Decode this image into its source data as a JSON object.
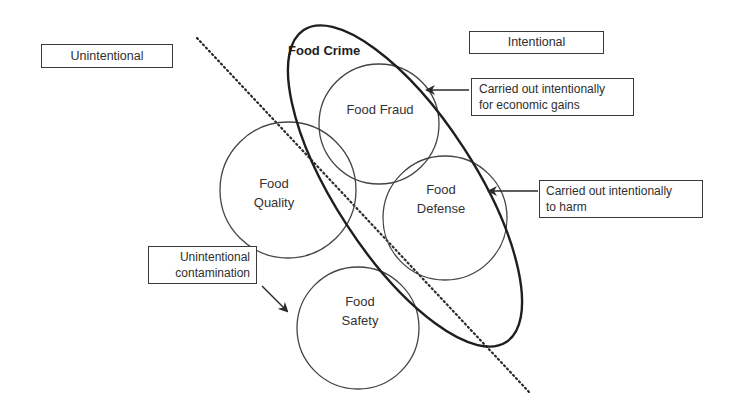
{
  "diagram": {
    "title": "Food Crime",
    "category_labels": {
      "unintentional": "Unintentional",
      "intentional": "Intentional"
    },
    "circles": [
      {
        "id": "food-fraud",
        "lines": [
          "Food Fraud"
        ]
      },
      {
        "id": "food-quality",
        "lines": [
          "Food",
          "Quality"
        ]
      },
      {
        "id": "food-defense",
        "lines": [
          "Food",
          "Defense"
        ]
      },
      {
        "id": "food-safety",
        "lines": [
          "Food",
          "Safety"
        ]
      }
    ],
    "callouts": [
      {
        "target": "food-fraud",
        "lines": [
          "Carried out intentionally",
          "for economic gains"
        ]
      },
      {
        "target": "food-defense",
        "lines": [
          "Carried out intentionally",
          "to harm"
        ]
      },
      {
        "target": "food-safety",
        "lines": [
          "Unintentional",
          "contamination"
        ]
      }
    ],
    "divider": "dotted line separating unintentional and intentional"
  }
}
